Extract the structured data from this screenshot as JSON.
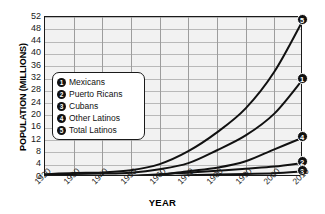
{
  "chart_data": {
    "type": "line",
    "title": "",
    "xlabel": "YEAR",
    "ylabel": "POPULATION (MILLIONS)",
    "x": [
      1920,
      1930,
      1940,
      1950,
      1960,
      1970,
      1980,
      1990,
      2000,
      2010
    ],
    "xlim": [
      1920,
      2010
    ],
    "ylim": [
      0,
      52
    ],
    "xtick_labels": [
      "1920",
      "1930",
      "1940",
      "1950",
      "1960",
      "1970",
      "1980",
      "1990",
      "2000",
      "2010"
    ],
    "ytick_labels": [
      "52",
      "48",
      "44",
      "40",
      "36",
      "32",
      "28",
      "24",
      "20",
      "16",
      "12",
      "8",
      "4",
      "0"
    ],
    "ytick_values": [
      52,
      48,
      44,
      40,
      36,
      32,
      28,
      24,
      20,
      16,
      12,
      8,
      4,
      0
    ],
    "grid": true,
    "legend_position": "inside-left",
    "series": [
      {
        "key": "1",
        "name": "Mexicans",
        "values": [
          0.7,
          1.0,
          1.1,
          1.4,
          2.5,
          4.5,
          8.7,
          13.5,
          20.6,
          31.8
        ],
        "end_value": 31.8
      },
      {
        "key": "2",
        "name": "Puerto Ricans",
        "values": [
          0.1,
          0.1,
          0.1,
          0.3,
          0.9,
          1.4,
          2.0,
          2.7,
          3.4,
          4.6
        ],
        "end_value": 4.6
      },
      {
        "key": "3",
        "name": "Cubans",
        "values": [
          0.0,
          0.0,
          0.0,
          0.1,
          0.1,
          0.6,
          0.8,
          1.0,
          1.2,
          1.8
        ],
        "end_value": 1.8
      },
      {
        "key": "4",
        "name": "Other Latinos",
        "values": [
          0.1,
          0.2,
          0.3,
          0.4,
          0.7,
          1.9,
          3.0,
          5.1,
          9.0,
          12.8
        ],
        "end_value": 12.8
      },
      {
        "key": "5",
        "name": "Total Latinos",
        "values": [
          0.9,
          1.3,
          1.5,
          2.2,
          4.2,
          8.4,
          14.5,
          22.3,
          34.2,
          51.0
        ],
        "end_value": 51.0
      }
    ]
  },
  "legend": {
    "items": [
      {
        "marker": "1",
        "label": "Mexicans"
      },
      {
        "marker": "2",
        "label": "Puerto Ricans"
      },
      {
        "marker": "3",
        "label": "Cubans"
      },
      {
        "marker": "4",
        "label": "Other Latinos"
      },
      {
        "marker": "5",
        "label": "Total Latinos"
      }
    ]
  },
  "colors": {
    "line": "#111111",
    "plot_background": "#f2f2f2",
    "grid": "#b9b9b9",
    "frame": "#1a1a1a",
    "page_background": "#ffffff"
  }
}
